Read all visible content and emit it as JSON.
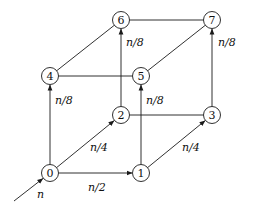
{
  "diagram": {
    "type": "directed-graph",
    "colors": {
      "stroke": "#1a1a1a",
      "background": "#ffffff"
    },
    "nodes": [
      {
        "id": "0",
        "label": "0",
        "x": 50,
        "y": 173
      },
      {
        "id": "1",
        "label": "1",
        "x": 141,
        "y": 173
      },
      {
        "id": "2",
        "label": "2",
        "x": 121,
        "y": 115
      },
      {
        "id": "3",
        "label": "3",
        "x": 212,
        "y": 115
      },
      {
        "id": "4",
        "label": "4",
        "x": 50,
        "y": 76
      },
      {
        "id": "5",
        "label": "5",
        "x": 141,
        "y": 76
      },
      {
        "id": "6",
        "label": "6",
        "x": 121,
        "y": 20
      },
      {
        "id": "7",
        "label": "7",
        "x": 212,
        "y": 20
      }
    ],
    "edges": [
      {
        "from": "0",
        "to": "1",
        "directed": true,
        "label": "n/2",
        "lx": 88,
        "ly": 191
      },
      {
        "from": "0",
        "to": "2",
        "directed": true,
        "label": "n/4",
        "lx": 90,
        "ly": 151
      },
      {
        "from": "0",
        "to": "4",
        "directed": true,
        "label": "n/8",
        "lx": 55,
        "ly": 104
      },
      {
        "from": "1",
        "to": "3",
        "directed": true,
        "label": "n/4",
        "lx": 182,
        "ly": 151
      },
      {
        "from": "1",
        "to": "5",
        "directed": true,
        "label": "n/8",
        "lx": 146,
        "ly": 104
      },
      {
        "from": "2",
        "to": "6",
        "directed": true,
        "label": "n/8",
        "lx": 126,
        "ly": 46
      },
      {
        "from": "3",
        "to": "7",
        "directed": true,
        "label": "n/8",
        "lx": 218,
        "ly": 46
      },
      {
        "from": "2",
        "to": "3",
        "directed": false,
        "label": ""
      },
      {
        "from": "4",
        "to": "5",
        "directed": false,
        "label": ""
      },
      {
        "from": "4",
        "to": "6",
        "directed": false,
        "label": ""
      },
      {
        "from": "5",
        "to": "7",
        "directed": false,
        "label": ""
      },
      {
        "from": "6",
        "to": "7",
        "directed": false,
        "label": ""
      }
    ],
    "input_edge": {
      "to": "0",
      "label": "n",
      "x1": 14,
      "y1": 201,
      "lx": 37,
      "ly": 198
    }
  }
}
